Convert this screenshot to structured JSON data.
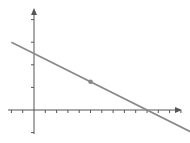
{
  "chart_data": {
    "type": "line",
    "title": "",
    "xlabel": "",
    "ylabel": "",
    "grid": false,
    "legend": null,
    "xlim": [
      -2,
      14
    ],
    "ylim": [
      -2,
      9
    ],
    "x_ticks": [
      -2,
      -1,
      0,
      1,
      2,
      3,
      4,
      5,
      6,
      7,
      8,
      9,
      10,
      11,
      12,
      13,
      14
    ],
    "y_ticks": [
      -2,
      2,
      4,
      6,
      8
    ],
    "series": [
      {
        "name": "line",
        "equation": "y = 5 - 0.5x",
        "x": [
          -2,
          14
        ],
        "y": [
          6,
          -2
        ]
      }
    ],
    "points": [
      {
        "x": 5,
        "y": 2.5,
        "label": ""
      }
    ],
    "colors": {
      "axis": "#555555",
      "line": "#888888",
      "point": "#888888"
    }
  }
}
